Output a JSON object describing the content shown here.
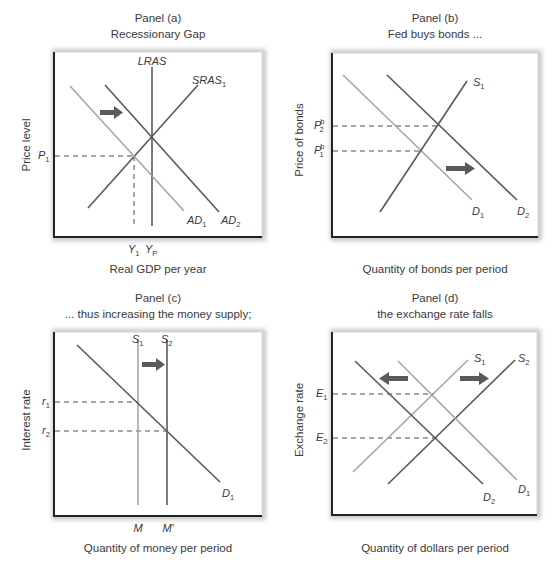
{
  "figure": {
    "panels": [
      {
        "id": "a",
        "title": "Panel (a)",
        "subtitle": "Recessionary Gap",
        "y_axis_label": "Price level",
        "x_axis_label": "Real GDP per year",
        "curve_labels": {
          "lras": "LRAS",
          "sras": "SRAS",
          "sras_sub": "1",
          "ad1": "AD",
          "ad1_sub": "1",
          "ad2": "AD",
          "ad2_sub": "2"
        },
        "y_ticks": [
          {
            "main": "P",
            "sub": "1"
          }
        ],
        "x_ticks": [
          {
            "main": "Y",
            "sub": "1"
          },
          {
            "main": "Y",
            "sub": "P"
          }
        ],
        "arrow_direction": "right"
      },
      {
        "id": "b",
        "title": "Panel (b)",
        "subtitle": "Fed buys bonds ...",
        "y_axis_label": "Price of bonds",
        "x_axis_label": "Quantity of bonds per period",
        "curve_labels": {
          "s1": "S",
          "s1_sub": "1",
          "d1": "D",
          "d1_sub": "1",
          "d2": "D",
          "d2_sub": "2"
        },
        "y_ticks": [
          {
            "main": "P",
            "sup": "b",
            "sub": "2"
          },
          {
            "main": "P",
            "sup": "b",
            "sub": "1"
          }
        ],
        "arrow_direction": "right"
      },
      {
        "id": "c",
        "title": "Panel (c)",
        "subtitle": "... thus increasing the money supply;",
        "y_axis_label": "Interest rate",
        "x_axis_label": "Quantity of money per period",
        "curve_labels": {
          "s1": "S",
          "s1_sub": "1",
          "s2": "S",
          "s2_sub": "2",
          "d1": "D",
          "d1_sub": "1"
        },
        "y_ticks": [
          {
            "main": "r",
            "sub": "1"
          },
          {
            "main": "r",
            "sub": "2"
          }
        ],
        "x_ticks": [
          {
            "main": "M"
          },
          {
            "main": "M′"
          }
        ],
        "arrow_direction": "right"
      },
      {
        "id": "d",
        "title": "Panel (d)",
        "subtitle": "the exchange rate falls",
        "y_axis_label": "Exchange rate",
        "x_axis_label": "Quantity of dollars per period",
        "curve_labels": {
          "s1": "S",
          "s1_sub": "1",
          "s2": "S",
          "s2_sub": "2",
          "d1": "D",
          "d1_sub": "1",
          "d2": "D",
          "d2_sub": "2"
        },
        "y_ticks": [
          {
            "main": "E",
            "sub": "1"
          },
          {
            "main": "E",
            "sub": "2"
          }
        ],
        "arrows": [
          "left",
          "right"
        ]
      }
    ],
    "colors": {
      "dark_curve": "#595959",
      "light_curve": "#a6a6a6",
      "arrow": "#5a5a5a",
      "axis": "#222222"
    }
  }
}
